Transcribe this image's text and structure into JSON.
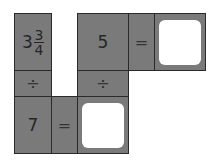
{
  "puzzle": {
    "top_row": {
      "first": {
        "whole": "3",
        "numerator": "3",
        "denominator": "4"
      },
      "second": "5",
      "equals": "=",
      "answer": ""
    },
    "middle_row": {
      "left_operator": "÷",
      "right_operator": "÷"
    },
    "bottom_row": {
      "first": "7",
      "equals": "=",
      "answer": ""
    }
  },
  "colors": {
    "cell_fill": "#7a7a7a",
    "border": "#2a2a2a",
    "answer_box": "#ffffff"
  }
}
